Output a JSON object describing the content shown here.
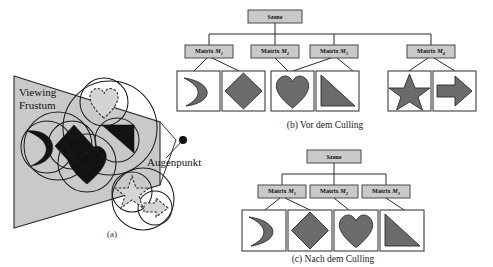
{
  "figure": {
    "background_color": "#ffffff",
    "node_fill": "#c9c9c9",
    "shape_fill": "#6b6b6b",
    "frustum_fill": "#c9c9c9"
  },
  "panel_a": {
    "caption": "(a)",
    "frustum_label_line1": "Viewing",
    "frustum_label_line2": "Frustum",
    "eye_label": "Augenpunkt",
    "objects_inside": [
      "crescent",
      "diamond",
      "heart",
      "triangle"
    ],
    "objects_outside": [
      "heart-dashed",
      "star-dashed",
      "arrow-dashed"
    ]
  },
  "panel_b": {
    "caption": "(b) Vor dem Culling",
    "root": "Szene",
    "matrices": [
      {
        "prefix": "Matrix ",
        "symbol": "M",
        "sub": "1"
      },
      {
        "prefix": "Matrix ",
        "symbol": "M",
        "sub": "2"
      },
      {
        "prefix": "Matrix ",
        "symbol": "M",
        "sub": "3"
      },
      {
        "prefix": "Matrix ",
        "symbol": "M",
        "sub": "4"
      }
    ],
    "leaves": [
      "crescent",
      "diamond",
      "heart",
      "triangle",
      "star",
      "arrow"
    ]
  },
  "panel_c": {
    "caption": "(c) Nach dem Culling",
    "root": "Szene",
    "matrices": [
      {
        "prefix": "Matrix ",
        "symbol": "M",
        "sub": "1"
      },
      {
        "prefix": "Matrix ",
        "symbol": "M",
        "sub": "2"
      },
      {
        "prefix": "Matrix ",
        "symbol": "M",
        "sub": "3"
      }
    ],
    "leaves": [
      "crescent",
      "diamond",
      "heart",
      "triangle"
    ]
  }
}
